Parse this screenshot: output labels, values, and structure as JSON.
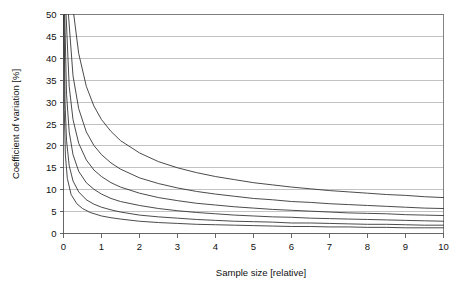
{
  "chart_data": {
    "type": "line",
    "title": "",
    "subtitle": "",
    "xlabel": "Sample size [relative]",
    "ylabel": "Coefficient of variation [%]",
    "xlim": [
      0,
      10
    ],
    "ylim": [
      0,
      50
    ],
    "xticks": [
      0,
      1,
      2,
      3,
      4,
      5,
      6,
      7,
      8,
      9,
      10
    ],
    "xtick_labels": [
      "0",
      "1",
      "2",
      "3",
      "4",
      "5",
      "6",
      "7",
      "8",
      "9",
      "10"
    ],
    "yticks": [
      0,
      5,
      10,
      15,
      20,
      25,
      30,
      35,
      40,
      45,
      50
    ],
    "ytick_labels": [
      "0",
      "5",
      "10",
      "15",
      "20",
      "25",
      "30",
      "35",
      "40",
      "45",
      "50"
    ],
    "grid": "horizontal",
    "legend": "none",
    "curve_color": "#2b2b2b",
    "grid_color": "#a8a8a8",
    "axis_color": "#555555",
    "background": "#ffffff",
    "relation": "CV = k / sqrt(n)",
    "series": [
      {
        "name": "k = 26",
        "k": 26,
        "x": [
          0.27,
          0.4,
          0.6,
          0.8,
          1.0,
          1.25,
          1.5,
          2.0,
          2.5,
          3.0,
          3.5,
          4.0,
          4.5,
          5.0,
          5.5,
          6.0,
          6.5,
          7.0,
          7.5,
          8.0,
          8.5,
          9.0,
          9.5,
          10.0
        ],
        "y": [
          50.0,
          41.1,
          33.6,
          29.1,
          26.0,
          23.3,
          21.2,
          18.4,
          16.4,
          15.0,
          13.9,
          13.0,
          12.3,
          11.6,
          11.1,
          10.6,
          10.2,
          9.8,
          9.5,
          9.2,
          8.9,
          8.7,
          8.4,
          8.2
        ]
      },
      {
        "name": "k = 18",
        "k": 18,
        "x": [
          0.13,
          0.25,
          0.4,
          0.6,
          0.8,
          1.0,
          1.25,
          1.5,
          2.0,
          2.5,
          3.0,
          3.5,
          4.0,
          4.5,
          5.0,
          5.5,
          6.0,
          6.5,
          7.0,
          7.5,
          8.0,
          8.5,
          9.0,
          9.5,
          10.0
        ],
        "y": [
          50.0,
          36.0,
          28.5,
          23.2,
          20.1,
          18.0,
          16.1,
          14.7,
          12.7,
          11.4,
          10.4,
          9.6,
          9.0,
          8.5,
          8.0,
          7.7,
          7.3,
          7.1,
          6.8,
          6.6,
          6.4,
          6.2,
          6.0,
          5.8,
          5.7
        ]
      },
      {
        "name": "k = 13",
        "k": 13,
        "x": [
          0.068,
          0.15,
          0.25,
          0.4,
          0.6,
          0.8,
          1.0,
          1.25,
          1.5,
          2.0,
          2.5,
          3.0,
          3.5,
          4.0,
          4.5,
          5.0,
          5.5,
          6.0,
          6.5,
          7.0,
          7.5,
          8.0,
          8.5,
          9.0,
          9.5,
          10.0
        ],
        "y": [
          50.0,
          33.6,
          26.0,
          20.6,
          16.8,
          14.5,
          13.0,
          11.6,
          10.6,
          9.2,
          8.2,
          7.5,
          6.9,
          6.5,
          6.1,
          5.8,
          5.5,
          5.3,
          5.1,
          4.9,
          4.7,
          4.6,
          4.5,
          4.3,
          4.2,
          4.1
        ]
      },
      {
        "name": "k = 9",
        "k": 9,
        "x": [
          0.032,
          0.08,
          0.15,
          0.25,
          0.4,
          0.6,
          0.8,
          1.0,
          1.25,
          1.5,
          2.0,
          2.5,
          3.0,
          3.5,
          4.0,
          4.5,
          5.0,
          5.5,
          6.0,
          6.5,
          7.0,
          7.5,
          8.0,
          8.5,
          9.0,
          9.5,
          10.0
        ],
        "y": [
          50.0,
          31.8,
          23.2,
          18.0,
          14.2,
          11.6,
          10.1,
          9.0,
          8.0,
          7.3,
          6.4,
          5.7,
          5.2,
          4.8,
          4.5,
          4.2,
          4.0,
          3.8,
          3.7,
          3.5,
          3.4,
          3.3,
          3.2,
          3.1,
          3.0,
          2.9,
          2.8
        ]
      },
      {
        "name": "k = 6",
        "k": 6,
        "x": [
          0.0144,
          0.04,
          0.08,
          0.15,
          0.25,
          0.4,
          0.6,
          0.8,
          1.0,
          1.25,
          1.5,
          2.0,
          2.5,
          3.0,
          3.5,
          4.0,
          4.5,
          5.0,
          5.5,
          6.0,
          6.5,
          7.0,
          7.5,
          8.0,
          8.5,
          9.0,
          9.5,
          10.0
        ],
        "y": [
          50.0,
          30.0,
          21.2,
          15.5,
          12.0,
          9.5,
          7.7,
          6.7,
          6.0,
          5.4,
          4.9,
          4.2,
          3.8,
          3.5,
          3.2,
          3.0,
          2.8,
          2.7,
          2.6,
          2.4,
          2.4,
          2.3,
          2.2,
          2.1,
          2.1,
          2.0,
          1.9,
          1.9
        ]
      },
      {
        "name": "k = 4",
        "k": 4,
        "x": [
          0.0064,
          0.02,
          0.05,
          0.1,
          0.2,
          0.35,
          0.5,
          0.7,
          1.0,
          1.25,
          1.5,
          2.0,
          2.5,
          3.0,
          3.5,
          4.0,
          4.5,
          5.0,
          5.5,
          6.0,
          6.5,
          7.0,
          7.5,
          8.0,
          8.5,
          9.0,
          9.5,
          10.0
        ],
        "y": [
          50.0,
          28.3,
          17.9,
          12.6,
          8.9,
          6.8,
          5.7,
          4.8,
          4.0,
          3.6,
          3.3,
          2.8,
          2.5,
          2.3,
          2.1,
          2.0,
          1.9,
          1.8,
          1.7,
          1.6,
          1.6,
          1.5,
          1.5,
          1.4,
          1.4,
          1.3,
          1.3,
          1.3
        ]
      }
    ]
  }
}
